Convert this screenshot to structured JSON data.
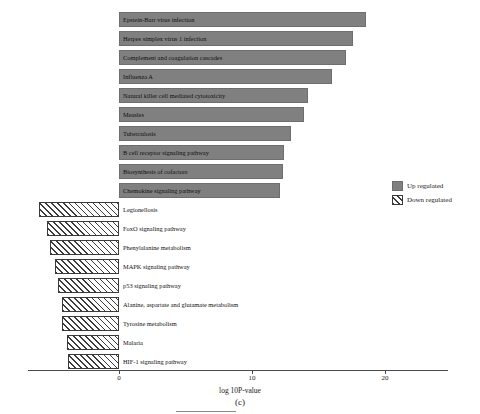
{
  "chart_data": {
    "type": "bar",
    "orientation": "horizontal",
    "title": "",
    "xlabel": "log 10P-value",
    "ylabel": "",
    "xlim": [
      -7.5,
      23.5
    ],
    "xticks": [
      0,
      10,
      20
    ],
    "xtick_labels": [
      "0",
      "10",
      "20"
    ],
    "grid": false,
    "legend_position": "right",
    "series": [
      {
        "name": "Up regulated",
        "style": "solid-gray",
        "color": "#808080",
        "direction": "right",
        "categories": [
          "Epstein-Barr virus infection",
          "Herpes simplex virus 1 infection",
          "Complement and coagulation cascades",
          "Influenza A",
          "Natural killer cell mediated cytotoxicity",
          "Measles",
          "Tuberculosis",
          "B cell receptor signaling pathway",
          "Biosynthesis of cofactors",
          "Chemokine signaling pathway"
        ],
        "values": [
          18.6,
          17.6,
          17.1,
          16.0,
          14.2,
          13.9,
          12.9,
          12.4,
          12.3,
          12.1
        ]
      },
      {
        "name": "Down regulated",
        "style": "hatched",
        "color": "#ffffff",
        "direction": "left",
        "categories": [
          "Legionellosis",
          "FoxO signaling pathway",
          "Phenylalanine metabolism",
          "MAPK signaling pathway",
          "p53 signaling pathway",
          "Alanine, aspartate and glutamate metabolism",
          "Tyrosine metabolism",
          "Malaria",
          "HIF-1 signaling pathway"
        ],
        "values": [
          -6.0,
          -5.4,
          -5.2,
          -4.8,
          -4.6,
          -4.3,
          -4.3,
          -3.9,
          -3.8
        ]
      }
    ]
  },
  "axis": {
    "xlabel": "log 10P-value",
    "ticks": [
      {
        "label": "0",
        "value": 0
      },
      {
        "label": "10",
        "value": 10
      },
      {
        "label": "20",
        "value": 20
      }
    ]
  },
  "legend": {
    "items": [
      {
        "label": "Up regulated",
        "swatch": "solid-gray"
      },
      {
        "label": "Down regulated",
        "swatch": "hatched"
      }
    ]
  },
  "caption": "(c)"
}
